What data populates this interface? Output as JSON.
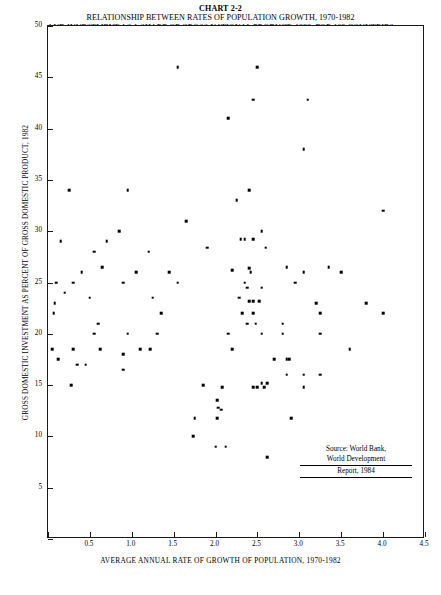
{
  "title": {
    "chart_number": "CHART 2-2",
    "line1": "RELATIONSHIP BETWEEN RATES OF POPULATION GROWTH, 1970-1982",
    "line2": "AND INVESTMENT AS A SHARE OF GROSS NATIONAL PRODUCT, 1982, FOR 103 COUNTRIES"
  },
  "source": {
    "line1": "Source: World Bank,",
    "line2": "World Development",
    "line3": "Report, 1984"
  },
  "chart_data": {
    "type": "scatter",
    "title": "RELATIONSHIP BETWEEN RATES OF POPULATION GROWTH, 1970-1982 AND INVESTMENT AS A SHARE OF GROSS NATIONAL PRODUCT, 1982, FOR 103 COUNTRIES",
    "xlabel": "AVERAGE ANNUAL RATE OF GROWTH OF POPULATION, 1970-1982",
    "ylabel": "GROSS DOMESTIC INVESTMENT AS PERCENT OF GROSS DOMESTIC PRODUCT, 1982",
    "xlim": [
      0,
      4.5
    ],
    "ylim": [
      0,
      50
    ],
    "xticks": [
      0,
      0.5,
      1.0,
      1.5,
      2.0,
      2.5,
      3.0,
      3.5,
      4.0,
      4.5
    ],
    "xticklabels": [
      "",
      "0.5",
      "1.0",
      "1.5",
      "2.0",
      "2.5",
      "3.0",
      "3.5",
      "4.0",
      "4.5"
    ],
    "yticks": [
      0,
      5,
      10,
      15,
      20,
      25,
      30,
      35,
      40,
      45,
      50
    ],
    "yticklabels": [
      "",
      "5",
      "10",
      "15",
      "20",
      "25",
      "30",
      "35",
      "40",
      "45",
      "50"
    ],
    "grid": false,
    "legend": false,
    "n_points": 103,
    "marker": "square",
    "marker_color": "#000000",
    "points": [
      [
        1.55,
        46.0
      ],
      [
        2.5,
        46.0
      ],
      [
        2.45,
        42.8
      ],
      [
        3.1,
        42.8
      ],
      [
        2.15,
        41.0
      ],
      [
        3.05,
        38.0
      ],
      [
        0.25,
        34.0
      ],
      [
        0.95,
        34.0
      ],
      [
        2.4,
        34.0
      ],
      [
        2.25,
        33.0
      ],
      [
        1.65,
        31.0
      ],
      [
        4.0,
        32.0
      ],
      [
        0.15,
        29.0
      ],
      [
        0.7,
        29.0
      ],
      [
        2.3,
        29.2
      ],
      [
        2.35,
        29.2
      ],
      [
        2.45,
        29.2
      ],
      [
        0.85,
        30.0
      ],
      [
        2.55,
        30.0
      ],
      [
        0.55,
        28.0
      ],
      [
        1.2,
        28.0
      ],
      [
        1.9,
        28.4
      ],
      [
        2.6,
        28.4
      ],
      [
        0.4,
        26.0
      ],
      [
        0.65,
        26.5
      ],
      [
        1.05,
        26.0
      ],
      [
        1.45,
        26.0
      ],
      [
        2.2,
        26.2
      ],
      [
        2.4,
        26.4
      ],
      [
        2.42,
        26.0
      ],
      [
        2.85,
        26.5
      ],
      [
        3.05,
        26.0
      ],
      [
        3.35,
        26.5
      ],
      [
        3.5,
        26.0
      ],
      [
        0.1,
        25.0
      ],
      [
        0.3,
        25.0
      ],
      [
        0.9,
        25.0
      ],
      [
        1.55,
        25.0
      ],
      [
        2.35,
        25.0
      ],
      [
        2.38,
        24.5
      ],
      [
        2.55,
        24.5
      ],
      [
        2.95,
        25.0
      ],
      [
        0.2,
        24.0
      ],
      [
        0.5,
        23.5
      ],
      [
        1.25,
        23.5
      ],
      [
        2.28,
        23.5
      ],
      [
        2.4,
        23.2
      ],
      [
        2.45,
        23.2
      ],
      [
        2.52,
        23.2
      ],
      [
        3.2,
        23.0
      ],
      [
        3.8,
        23.0
      ],
      [
        0.08,
        23.0
      ],
      [
        0.07,
        22.0
      ],
      [
        1.35,
        22.0
      ],
      [
        2.32,
        22.0
      ],
      [
        2.45,
        22.0
      ],
      [
        3.25,
        22.0
      ],
      [
        4.0,
        22.0
      ],
      [
        0.6,
        21.0
      ],
      [
        2.38,
        21.0
      ],
      [
        2.48,
        21.0
      ],
      [
        2.8,
        21.0
      ],
      [
        0.55,
        20.0
      ],
      [
        0.95,
        20.0
      ],
      [
        1.3,
        20.0
      ],
      [
        2.15,
        20.0
      ],
      [
        2.55,
        20.0
      ],
      [
        2.8,
        20.0
      ],
      [
        3.25,
        20.0
      ],
      [
        0.05,
        18.5
      ],
      [
        0.3,
        18.5
      ],
      [
        0.62,
        18.5
      ],
      [
        0.9,
        18.0
      ],
      [
        1.1,
        18.5
      ],
      [
        1.22,
        18.5
      ],
      [
        2.2,
        18.5
      ],
      [
        3.6,
        18.5
      ],
      [
        0.12,
        17.5
      ],
      [
        0.35,
        17.0
      ],
      [
        0.45,
        17.0
      ],
      [
        2.7,
        17.5
      ],
      [
        2.85,
        17.5
      ],
      [
        2.88,
        17.5
      ],
      [
        0.9,
        16.5
      ],
      [
        2.85,
        16.0
      ],
      [
        3.05,
        16.0
      ],
      [
        3.25,
        16.0
      ],
      [
        1.85,
        15.0
      ],
      [
        2.55,
        15.2
      ],
      [
        2.62,
        15.2
      ],
      [
        0.28,
        15.0
      ],
      [
        2.08,
        14.8
      ],
      [
        2.45,
        14.8
      ],
      [
        2.5,
        14.8
      ],
      [
        2.58,
        14.8
      ],
      [
        3.05,
        14.8
      ],
      [
        2.02,
        13.5
      ],
      [
        2.03,
        12.8
      ],
      [
        2.07,
        12.6
      ],
      [
        1.75,
        11.8
      ],
      [
        2.02,
        11.8
      ],
      [
        2.9,
        11.8
      ],
      [
        1.73,
        10.0
      ],
      [
        2.0,
        9.0
      ],
      [
        2.12,
        9.0
      ],
      [
        2.62,
        8.0
      ]
    ]
  }
}
